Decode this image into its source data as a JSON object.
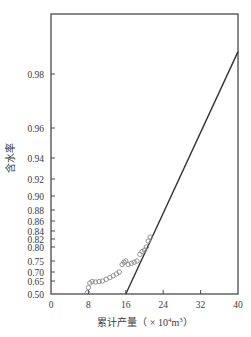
{
  "chart_data": {
    "type": "scatter",
    "title": "",
    "xlabel": "累计产量（×10⁴m³）",
    "xlabel_parts": {
      "main": "累计产量（ × 10",
      "sup": "4",
      "unit": "m",
      "unit_sup": "3",
      "close": "）"
    },
    "ylabel": "含水率",
    "xlim": [
      0,
      40
    ],
    "ylim": [
      0.5,
      0.99
    ],
    "y_scale": "log(1-fw) water-cut scale",
    "grid": false,
    "legend": null,
    "x_ticks": [
      0,
      8,
      16,
      24,
      32,
      40
    ],
    "x_tick_labels": [
      "0",
      "8",
      "16",
      "24",
      "32",
      "40"
    ],
    "y_ticks": [
      {
        "label": "0.98",
        "py": 74
      },
      {
        "label": "0.96",
        "py": 128
      },
      {
        "label": "0.94",
        "py": 158
      },
      {
        "label": "0.92",
        "py": 179
      },
      {
        "label": "0.90",
        "py": 196
      },
      {
        "label": "0.88",
        "py": 210
      },
      {
        "label": "0.86",
        "py": 221
      },
      {
        "label": "0.84",
        "py": 231
      },
      {
        "label": "0.82",
        "py": 239
      },
      {
        "label": "0.80",
        "py": 247
      },
      {
        "label": "0.75",
        "py": 261
      },
      {
        "label": "0.70",
        "py": 272
      },
      {
        "label": "0.65",
        "py": 281
      },
      {
        "label": "0.50",
        "py": 294
      }
    ],
    "series": [
      {
        "name": "实际含水率",
        "type": "scatter",
        "marker": "open-circle",
        "color": "#8a8a8a",
        "points": [
          {
            "x": 7.8,
            "y": 0.52
          },
          {
            "x": 8.0,
            "y": 0.58
          },
          {
            "x": 8.3,
            "y": 0.63
          },
          {
            "x": 8.8,
            "y": 0.645
          },
          {
            "x": 9.5,
            "y": 0.64
          },
          {
            "x": 10.3,
            "y": 0.645
          },
          {
            "x": 11.0,
            "y": 0.65
          },
          {
            "x": 11.8,
            "y": 0.66
          },
          {
            "x": 12.6,
            "y": 0.67
          },
          {
            "x": 13.3,
            "y": 0.68
          },
          {
            "x": 14.0,
            "y": 0.69
          },
          {
            "x": 14.6,
            "y": 0.7
          },
          {
            "x": 15.2,
            "y": 0.735
          },
          {
            "x": 15.6,
            "y": 0.745
          },
          {
            "x": 16.0,
            "y": 0.75
          },
          {
            "x": 16.5,
            "y": 0.735
          },
          {
            "x": 17.2,
            "y": 0.74
          },
          {
            "x": 17.8,
            "y": 0.745
          },
          {
            "x": 18.4,
            "y": 0.75
          },
          {
            "x": 19.0,
            "y": 0.775
          },
          {
            "x": 19.5,
            "y": 0.785
          },
          {
            "x": 20.0,
            "y": 0.79
          },
          {
            "x": 20.4,
            "y": 0.8
          },
          {
            "x": 20.8,
            "y": 0.815
          },
          {
            "x": 21.2,
            "y": 0.825
          }
        ]
      },
      {
        "name": "拟合直线",
        "type": "line",
        "color": "#333333",
        "points": [
          {
            "x": 16.0,
            "y": 0.5
          },
          {
            "x": 40.0,
            "y": 0.985
          }
        ]
      }
    ]
  }
}
